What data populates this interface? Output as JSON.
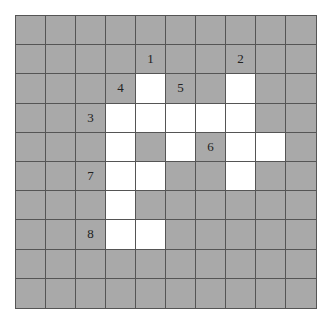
{
  "puzzle": {
    "rows": 10,
    "cols": 10,
    "colors": {
      "blocked": "#a9a9a9",
      "open": "#ffffff",
      "line": "#555555"
    },
    "open_cells": [
      [
        2,
        4
      ],
      [
        2,
        7
      ],
      [
        3,
        3
      ],
      [
        3,
        4
      ],
      [
        3,
        5
      ],
      [
        3,
        6
      ],
      [
        3,
        7
      ],
      [
        4,
        3
      ],
      [
        4,
        5
      ],
      [
        4,
        7
      ],
      [
        4,
        8
      ],
      [
        5,
        3
      ],
      [
        5,
        4
      ],
      [
        5,
        7
      ],
      [
        6,
        3
      ],
      [
        7,
        3
      ],
      [
        7,
        4
      ]
    ],
    "clue_numbers": [
      {
        "label": "1",
        "row": 1,
        "col": 4
      },
      {
        "label": "2",
        "row": 1,
        "col": 7
      },
      {
        "label": "4",
        "row": 2,
        "col": 3
      },
      {
        "label": "5",
        "row": 2,
        "col": 5
      },
      {
        "label": "3",
        "row": 3,
        "col": 2
      },
      {
        "label": "6",
        "row": 4,
        "col": 6
      },
      {
        "label": "7",
        "row": 5,
        "col": 2
      },
      {
        "label": "8",
        "row": 7,
        "col": 2
      }
    ]
  }
}
